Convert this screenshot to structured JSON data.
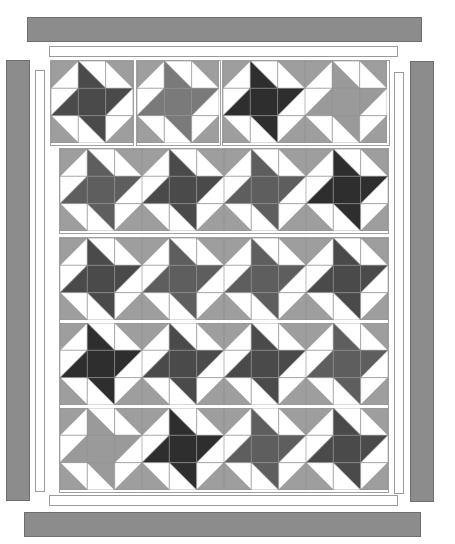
{
  "diagram": {
    "colors": {
      "background": "#ffffff",
      "outer_border": "#8c8c8c",
      "inner_strip": "#ffffff",
      "seam_line": "#8a8a8a",
      "corner_light": "#9e9e9e",
      "star_shades": {
        "dark": "#2e2e2e",
        "medium_dark": "#4a4a4a",
        "medium": "#5e5e5e",
        "light_medium": "#7a7a7a",
        "light": "#9a9a9a"
      }
    },
    "borders": {
      "top_bar": {
        "x": 27,
        "y": 17,
        "w": 395,
        "h": 25
      },
      "top_strip": {
        "x": 49,
        "y": 46,
        "w": 349,
        "h": 11
      },
      "bottom_strip": {
        "x": 49,
        "y": 495,
        "w": 349,
        "h": 11
      },
      "bottom_bar": {
        "x": 24,
        "y": 512,
        "w": 397,
        "h": 25
      },
      "left_bar": {
        "x": 6,
        "y": 60,
        "w": 24,
        "h": 441
      },
      "left_strip": {
        "x": 35,
        "y": 70,
        "w": 10,
        "h": 422
      },
      "right_bar": {
        "x": 410,
        "y": 61,
        "w": 24,
        "h": 441
      },
      "right_strip": {
        "x": 394,
        "y": 72,
        "w": 10,
        "h": 422
      }
    },
    "sections": [
      {
        "name": "top-row-panels",
        "panels": [
          {
            "x": 50,
            "y": 60,
            "w": 84,
            "h": 86,
            "blocks": [
              {
                "x": 51,
                "y": 61,
                "size": 82,
                "shade": "medium_dark"
              }
            ]
          },
          {
            "x": 136,
            "y": 60,
            "w": 85,
            "h": 86,
            "blocks": [
              {
                "x": 137,
                "y": 61,
                "size": 82,
                "shade": "light_medium"
              }
            ]
          },
          {
            "x": 222,
            "y": 60,
            "w": 168,
            "h": 86,
            "blocks": [
              {
                "x": 223,
                "y": 61,
                "size": 82,
                "shade": "dark"
              },
              {
                "x": 305,
                "y": 61,
                "size": 82,
                "shade": "light"
              }
            ]
          }
        ]
      },
      {
        "name": "middle-row",
        "panels": [
          {
            "x": 59,
            "y": 148,
            "w": 330,
            "h": 86,
            "blocks": [
              {
                "x": 60,
                "y": 149,
                "size": 82,
                "shade": "medium"
              },
              {
                "x": 142,
                "y": 149,
                "size": 82,
                "shade": "medium_dark"
              },
              {
                "x": 224,
                "y": 149,
                "size": 82,
                "shade": "medium"
              },
              {
                "x": 306,
                "y": 149,
                "size": 82,
                "shade": "dark"
              }
            ]
          }
        ]
      },
      {
        "name": "main-field",
        "panels": [
          {
            "x": 59,
            "y": 237,
            "w": 330,
            "h": 256,
            "blocks": [
              {
                "x": 60,
                "y": 238,
                "size": 82,
                "shade": "medium_dark"
              },
              {
                "x": 142,
                "y": 238,
                "size": 82,
                "shade": "medium"
              },
              {
                "x": 224,
                "y": 238,
                "size": 82,
                "shade": "medium"
              },
              {
                "x": 306,
                "y": 238,
                "size": 82,
                "shade": "medium_dark"
              },
              {
                "x": 60,
                "y": 323,
                "size": 82,
                "shade": "dark"
              },
              {
                "x": 142,
                "y": 323,
                "size": 82,
                "shade": "medium_dark"
              },
              {
                "x": 224,
                "y": 323,
                "size": 82,
                "shade": "medium_dark"
              },
              {
                "x": 306,
                "y": 323,
                "size": 82,
                "shade": "medium"
              },
              {
                "x": 60,
                "y": 408,
                "size": 82,
                "shade": "light"
              },
              {
                "x": 142,
                "y": 408,
                "size": 82,
                "shade": "dark"
              },
              {
                "x": 224,
                "y": 408,
                "size": 82,
                "shade": "medium"
              },
              {
                "x": 306,
                "y": 408,
                "size": 82,
                "shade": "medium_dark"
              }
            ]
          }
        ]
      }
    ]
  }
}
